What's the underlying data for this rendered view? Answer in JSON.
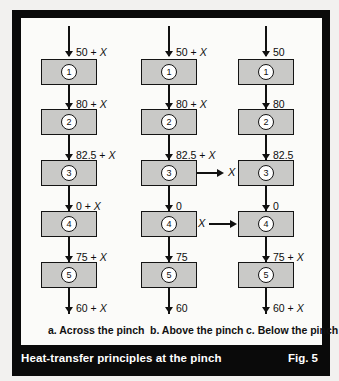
{
  "figure": {
    "caption": "Heat-transfer principles at the pinch",
    "fig_number": "Fig. 5"
  },
  "columns": [
    {
      "id": "a",
      "subcaption": "a. Across the pinch",
      "stream_labels": [
        "50 + X",
        "80 + X",
        "82.5 + X",
        "0 + X",
        "75 + X",
        "60 + X"
      ],
      "boxes": [
        "1",
        "2",
        "3",
        "4",
        "5"
      ],
      "side_flow": null
    },
    {
      "id": "b",
      "subcaption": "b. Above the pinch",
      "stream_labels": [
        "50 + X",
        "80 + X",
        "82.5 + X",
        "0",
        "75",
        "60"
      ],
      "boxes": [
        "1",
        "2",
        "3",
        "4",
        "5"
      ],
      "side_flow": {
        "label": "X",
        "direction": "out",
        "from_box": "3"
      }
    },
    {
      "id": "c",
      "subcaption": "c. Below the pinch",
      "stream_labels": [
        "50",
        "80",
        "82.5",
        "0",
        "75 + X",
        "60 + X"
      ],
      "boxes": [
        "1",
        "2",
        "3",
        "4",
        "5"
      ],
      "side_flow": {
        "label": "X",
        "direction": "in",
        "to_box": "4"
      }
    }
  ],
  "colors": {
    "frame": "#0a0a0a",
    "panel": "#fbfbf9",
    "box_fill": "#c9c9c7",
    "line": "#111111",
    "caption_text": "#ffffff"
  }
}
